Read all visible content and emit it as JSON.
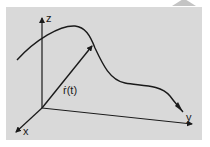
{
  "diagram": {
    "type": "3d-space-curve",
    "axes": {
      "z_label": "z",
      "x_label": "x",
      "y_label": "y"
    },
    "vector_label": "ṙ(t)",
    "colors": {
      "panel": "#d9d9d9",
      "stroke": "#1a1a1a",
      "background": "#ffffff"
    }
  }
}
